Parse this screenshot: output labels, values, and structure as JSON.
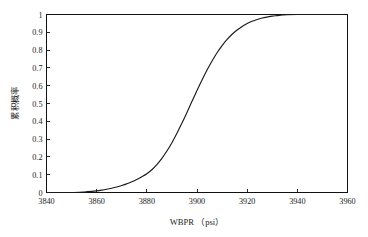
{
  "chart_data": {
    "type": "line",
    "title": "",
    "subtitle": "",
    "xlabel": "WBPR （psi）",
    "ylabel": "累积概率",
    "xlim": [
      3840,
      3960
    ],
    "ylim": [
      0,
      1
    ],
    "grid": false,
    "legend": null,
    "legend_position": "none",
    "xticks": [
      3840,
      3860,
      3880,
      3900,
      3920,
      3940,
      3960
    ],
    "xtick_labels": [
      "3840",
      "3860",
      "3880",
      "3900",
      "3920",
      "3940",
      "3960"
    ],
    "yticks": [
      0,
      0.1,
      0.2,
      0.3,
      0.4,
      0.5,
      0.6,
      0.7,
      0.8,
      0.9,
      1
    ],
    "ytick_labels": [
      "0",
      "0.1",
      "0.2",
      "0.3",
      "0.4",
      "0.5",
      "0.6",
      "0.7",
      "0.8",
      "0.9",
      "1"
    ],
    "series": [
      {
        "name": "cumulative-probability",
        "color": "#1a1a1a",
        "x": [
          3840,
          3845,
          3850,
          3855,
          3858,
          3860,
          3862,
          3864,
          3866,
          3868,
          3870,
          3872,
          3874,
          3876,
          3878,
          3880,
          3882,
          3884,
          3886,
          3888,
          3890,
          3892,
          3894,
          3896,
          3898,
          3900,
          3902,
          3904,
          3906,
          3908,
          3910,
          3912,
          3914,
          3916,
          3918,
          3920,
          3922,
          3924,
          3926,
          3928,
          3930,
          3932,
          3934,
          3936,
          3940,
          3945,
          3950,
          3955,
          3960
        ],
        "y": [
          0.0,
          0.0,
          0.0,
          0.003,
          0.006,
          0.009,
          0.013,
          0.018,
          0.024,
          0.031,
          0.039,
          0.049,
          0.06,
          0.073,
          0.088,
          0.105,
          0.128,
          0.157,
          0.192,
          0.233,
          0.28,
          0.333,
          0.39,
          0.45,
          0.512,
          0.573,
          0.632,
          0.688,
          0.739,
          0.785,
          0.825,
          0.86,
          0.889,
          0.913,
          0.933,
          0.949,
          0.962,
          0.972,
          0.98,
          0.986,
          0.991,
          0.994,
          0.997,
          0.999,
          1.0,
          1.0,
          1.0,
          1.0,
          1.0
        ]
      }
    ],
    "annotations": []
  },
  "axes": {
    "x_axis_title": "WBPR （psi）",
    "y_axis_title": "累积概率"
  },
  "style": {
    "background_color": "#ffffff",
    "line_color": "#1a1a1a",
    "frame_color": "#111111",
    "text_color": "#1c1c1c"
  }
}
